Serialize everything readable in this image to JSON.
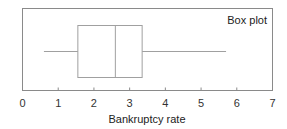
{
  "chart_data": {
    "type": "box",
    "title": "Box plot",
    "xlabel": "Bankruptcy rate",
    "ylabel": "",
    "xlim": [
      0,
      7
    ],
    "xticks": [
      0,
      1,
      2,
      3,
      4,
      5,
      6,
      7
    ],
    "xtick_labels": [
      "0",
      "1",
      "2",
      "3",
      "4",
      "5",
      "6",
      "7"
    ],
    "orientation": "horizontal",
    "grid": false,
    "legend": null,
    "box": {
      "whisker_low": 0.6,
      "q1": 1.55,
      "median": 2.6,
      "q3": 3.35,
      "whisker_high": 5.7
    }
  },
  "colors": {
    "frame": "#8a8a8a",
    "box": "#a0a0a0",
    "text": "#222222"
  }
}
